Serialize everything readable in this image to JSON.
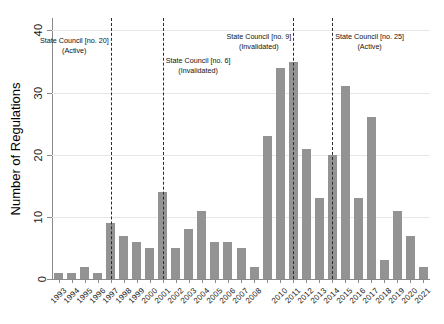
{
  "chart_data": {
    "type": "bar",
    "title": "",
    "subtitle": "",
    "xlabel": "",
    "ylabel": "Number of Regulations",
    "ylim": [
      0,
      42
    ],
    "yticks": [
      0,
      10,
      20,
      30,
      40
    ],
    "ytick_labels": [
      "0",
      "10",
      "20",
      "30",
      "40"
    ],
    "grid": true,
    "grid_axis": "y",
    "legend": "none",
    "bar_color": "#939393",
    "categories": [
      "1993",
      "1994",
      "1995",
      "1996",
      "1997",
      "1998",
      "1999",
      "2000",
      "2001",
      "2002",
      "2003",
      "2004",
      "2005",
      "2006",
      "2007",
      "2008",
      "2009",
      "2010",
      "2011",
      "2012",
      "2013",
      "2014",
      "2015",
      "2016",
      "2017",
      "2018",
      "2019",
      "2020",
      "2021"
    ],
    "tick_labels": [
      "1993",
      "1994",
      "1995",
      "1996",
      "1997",
      "1998",
      "1999",
      "2000",
      "2001",
      "2002",
      "2003",
      "2004",
      "2005",
      "2006",
      "2007",
      "2008",
      "",
      "2010",
      "2011",
      "2012",
      "2013",
      "2014",
      "2015",
      "2016",
      "2017",
      "2018",
      "2019",
      "2020",
      "2021"
    ],
    "values": [
      1,
      1,
      2,
      1,
      9,
      7,
      6,
      5,
      14,
      5,
      8,
      11,
      6,
      6,
      5,
      2,
      23,
      34,
      35,
      21,
      13,
      20,
      31,
      13,
      26,
      3,
      11,
      7,
      2
    ],
    "annotations": [
      {
        "name": "state-council-no-20",
        "line1": "State Council [no. 20]",
        "line2": "(Active)",
        "at_category": "1997",
        "line_color": "#2b2b2b",
        "side": "left"
      },
      {
        "name": "state-council-no-6",
        "line1": "State Council [no. 6]",
        "line2": "(Invalidated)",
        "at_category": "2001",
        "line_color": "#2b2b2b",
        "side": "right"
      },
      {
        "name": "state-council-no-9",
        "line1": "State Council [no. 9]",
        "line2": "(Invalidated)",
        "at_category": "2011",
        "line_color": "#2b2b2b",
        "side": "left"
      },
      {
        "name": "state-council-no-25",
        "line1": "State Council [no. 25]",
        "line2": "(Active)",
        "at_category": "2014",
        "line_color": "#2b2b2b",
        "side": "right"
      }
    ]
  }
}
